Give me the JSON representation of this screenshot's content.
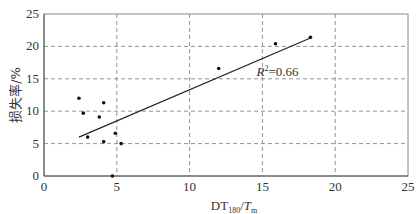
{
  "chart_data": {
    "type": "scatter",
    "title": "",
    "xlabel": "DT180/Tm",
    "xlabel_main": "DT",
    "xlabel_sub": "180",
    "xlabel_slash": "/",
    "xlabel_italic": "T",
    "xlabel_italic_sub": "m",
    "ylabel": "损失率/%",
    "xlim": [
      0,
      25
    ],
    "ylim": [
      0,
      25
    ],
    "xticks": [
      0,
      5,
      10,
      15,
      20,
      25
    ],
    "yticks": [
      0,
      5,
      10,
      15,
      20,
      25
    ],
    "grid": true,
    "series": [
      {
        "name": "data",
        "points": [
          {
            "x": 2.4,
            "y": 12.0
          },
          {
            "x": 2.7,
            "y": 9.7
          },
          {
            "x": 3.0,
            "y": 6.0
          },
          {
            "x": 3.8,
            "y": 9.1
          },
          {
            "x": 4.1,
            "y": 11.3
          },
          {
            "x": 4.1,
            "y": 5.3
          },
          {
            "x": 4.7,
            "y": 0.0
          },
          {
            "x": 4.9,
            "y": 6.6
          },
          {
            "x": 5.3,
            "y": 5.0
          },
          {
            "x": 12.0,
            "y": 16.6
          },
          {
            "x": 15.9,
            "y": 20.4
          },
          {
            "x": 18.3,
            "y": 21.4
          }
        ]
      }
    ],
    "trendline": {
      "x1": 2.4,
      "y1": 6.0,
      "x2": 18.3,
      "y2": 21.3
    },
    "annotation": {
      "text_italic": "R",
      "sup": "2",
      "text": "=0.66",
      "x": 14.6,
      "y": 16.0
    }
  }
}
